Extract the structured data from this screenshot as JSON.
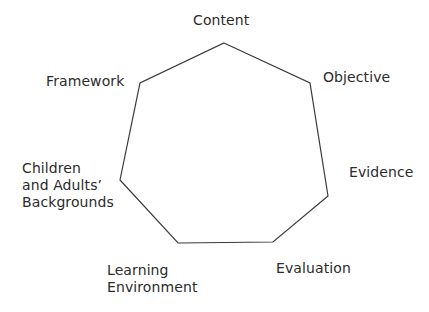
{
  "diagram": {
    "shape": "heptagon",
    "stroke_color": "#3a3a3a",
    "vertices": [
      {
        "name": "content",
        "x": 224,
        "y": 43
      },
      {
        "name": "objective",
        "x": 310,
        "y": 83
      },
      {
        "name": "evidence",
        "x": 328,
        "y": 196
      },
      {
        "name": "evaluation",
        "x": 273,
        "y": 242
      },
      {
        "name": "learning-environment",
        "x": 178,
        "y": 243
      },
      {
        "name": "backgrounds",
        "x": 120,
        "y": 180
      },
      {
        "name": "framework",
        "x": 140,
        "y": 83
      }
    ],
    "labels": {
      "content": "Content",
      "objective": "Objective",
      "evidence": "Evidence",
      "evaluation": "Evaluation",
      "learning_line1": "Learning",
      "learning_line2": "Environment",
      "backgrounds_line1": "Children",
      "backgrounds_line2": "and Adults’",
      "backgrounds_line3": "Backgrounds",
      "framework": "Framework"
    }
  }
}
